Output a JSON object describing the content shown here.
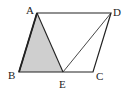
{
  "diagram": {
    "title": "",
    "points": {
      "A": {
        "label": "A",
        "x": 37,
        "y": 13
      },
      "B": {
        "label": "B",
        "x": 19,
        "y": 72
      },
      "C": {
        "label": "C",
        "x": 93,
        "y": 72
      },
      "D": {
        "label": "D",
        "x": 111,
        "y": 13
      },
      "E": {
        "label": "E",
        "x": 63,
        "y": 72
      }
    },
    "shape": "parallelogram ABCD",
    "segments": [
      "AB",
      "BC",
      "CD",
      "DA",
      "AE",
      "DE"
    ],
    "shaded_region": "triangle ABE",
    "colors": {
      "stroke": "#222222",
      "shade": "#cfcfcf",
      "background": "#ffffff"
    }
  }
}
